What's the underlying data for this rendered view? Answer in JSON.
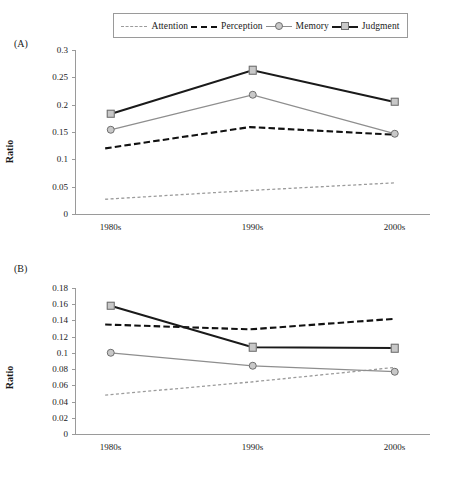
{
  "legend": {
    "items": [
      {
        "label": "Attention",
        "style": "dashed-light",
        "marker": "none",
        "color": "#9b9b9b"
      },
      {
        "label": "Perception",
        "style": "dashed-dark",
        "marker": "none",
        "color": "#111111"
      },
      {
        "label": "Memory",
        "style": "solid-light",
        "marker": "circle",
        "color": "#8e8e8e"
      },
      {
        "label": "Judgment",
        "style": "solid-dark",
        "marker": "square",
        "color": "#1a1a1a"
      }
    ]
  },
  "panels": {
    "a": {
      "tag": "(A)",
      "ylabel": "Ratio"
    },
    "b": {
      "tag": "(B)",
      "ylabel": "Ratio"
    }
  },
  "chart_data": [
    {
      "type": "line",
      "panel": "(A)",
      "title": "",
      "xlabel": "",
      "ylabel": "Ratio",
      "categories": [
        "1980s",
        "1990s",
        "2000s"
      ],
      "ylim": [
        0,
        0.3
      ],
      "yticks": [
        0,
        0.05,
        0.1,
        0.15,
        0.2,
        0.25,
        0.3
      ],
      "ytick_labels": [
        "0",
        "0.05",
        "0.1",
        "0.15",
        "0.2",
        "0.25",
        "0.3"
      ],
      "grid": false,
      "legend_position": "top",
      "series": [
        {
          "name": "Attention",
          "values": [
            0.027,
            0.043,
            0.057
          ],
          "style": "dashed-light",
          "marker": "none"
        },
        {
          "name": "Perception",
          "values": [
            0.12,
            0.159,
            0.145
          ],
          "style": "dashed-dark",
          "marker": "none"
        },
        {
          "name": "Memory",
          "values": [
            0.154,
            0.218,
            0.147
          ],
          "style": "solid-light",
          "marker": "circle"
        },
        {
          "name": "Judgment",
          "values": [
            0.183,
            0.263,
            0.205
          ],
          "style": "solid-dark",
          "marker": "square"
        }
      ]
    },
    {
      "type": "line",
      "panel": "(B)",
      "title": "",
      "xlabel": "",
      "ylabel": "Ratio",
      "categories": [
        "1980s",
        "1990s",
        "2000s"
      ],
      "ylim": [
        0,
        0.18
      ],
      "yticks": [
        0,
        0.02,
        0.04,
        0.06,
        0.08,
        0.1,
        0.12,
        0.14,
        0.16,
        0.18
      ],
      "ytick_labels": [
        "0",
        "0.02",
        "0.04",
        "0.06",
        "0.08",
        "0.1",
        "0.12",
        "0.14",
        "0.16",
        "0.18"
      ],
      "grid": false,
      "legend_position": "top",
      "series": [
        {
          "name": "Attention",
          "values": [
            0.048,
            0.064,
            0.082
          ],
          "style": "dashed-light",
          "marker": "none"
        },
        {
          "name": "Perception",
          "values": [
            0.135,
            0.129,
            0.142
          ],
          "style": "dashed-dark",
          "marker": "none"
        },
        {
          "name": "Memory",
          "values": [
            0.1,
            0.084,
            0.077
          ],
          "style": "solid-light",
          "marker": "circle"
        },
        {
          "name": "Judgment",
          "values": [
            0.158,
            0.107,
            0.106
          ],
          "style": "solid-dark",
          "marker": "square"
        }
      ]
    }
  ]
}
